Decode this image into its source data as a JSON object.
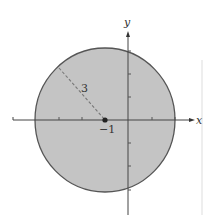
{
  "figure": {
    "colors": {
      "fill": "#c4c4c4",
      "stroke": "#555555",
      "axis": "#444444",
      "dash": "#777777",
      "background": "#ffffff"
    },
    "axes": {
      "x_label": "x",
      "y_label": "y",
      "unit_px": 23,
      "origin_px": [
        128,
        120
      ],
      "x_ticks": [
        -5,
        -4,
        -3,
        -2,
        -1,
        1,
        2
      ],
      "y_ticks": [
        -3,
        -2,
        -1,
        1,
        2,
        3
      ]
    },
    "circle": {
      "center": [
        -1,
        0
      ],
      "radius": 3,
      "center_label": "−1",
      "radius_label": "3"
    }
  }
}
